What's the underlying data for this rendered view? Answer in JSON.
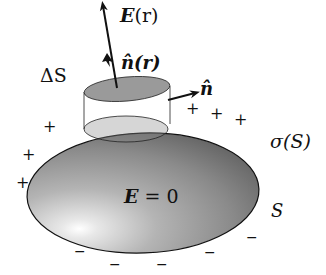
{
  "diagram": {
    "labels": {
      "field": "E(r)",
      "field_vec": "E",
      "field_arg": "(r)",
      "normal_r": "n̂(r)",
      "normal_side": "n̂",
      "delta_s": "ΔS",
      "sigma": "σ(S)",
      "surface": "S",
      "inside_vec": "E",
      "inside_eq": " = 0"
    },
    "charges": {
      "positive": "+",
      "negative": "−"
    },
    "colors": {
      "conductor_light": "#f4f4f4",
      "conductor_dark": "#5a5a5a",
      "pillbox": "#9a9a9a",
      "stroke": "#111111"
    }
  }
}
